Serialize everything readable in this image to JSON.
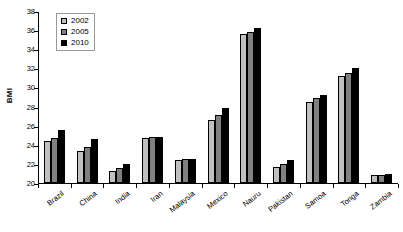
{
  "chart_data": {
    "type": "bar",
    "title": "",
    "xlabel": "",
    "ylabel": "BMI",
    "ylim": [
      20,
      38
    ],
    "yticks": [
      20,
      22,
      24,
      26,
      28,
      30,
      32,
      34,
      36,
      38
    ],
    "grid": false,
    "legend_position": "top-left",
    "categories": [
      "Brazil",
      "China",
      "India",
      "Iran",
      "Malaysia",
      "Mexico",
      "Nauru",
      "Pakistan",
      "Samoa",
      "Tonga",
      "Zambia"
    ],
    "series": [
      {
        "name": "2002",
        "color": "#c0c0c0",
        "values": [
          24.4,
          23.3,
          21.3,
          24.75,
          22.45,
          26.55,
          35.6,
          21.65,
          28.5,
          31.15,
          20.8
        ]
      },
      {
        "name": "2005",
        "color": "#808080",
        "values": [
          24.75,
          23.75,
          21.55,
          24.85,
          22.5,
          27.1,
          35.85,
          21.95,
          28.9,
          31.5,
          20.85
        ]
      },
      {
        "name": "2010",
        "color": "#000000",
        "values": [
          25.5,
          24.6,
          22.0,
          24.85,
          22.5,
          27.8,
          36.25,
          22.45,
          29.2,
          32.0,
          20.95
        ]
      }
    ]
  },
  "legend": {
    "items": [
      {
        "label": "2002"
      },
      {
        "label": "2005"
      },
      {
        "label": "2010"
      }
    ]
  }
}
